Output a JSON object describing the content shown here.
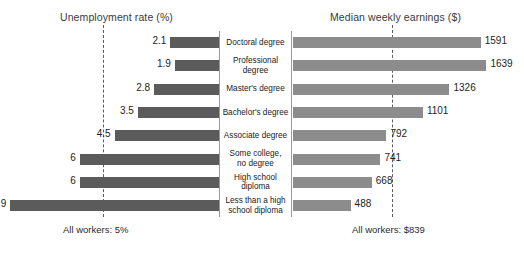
{
  "header": {
    "left_title": "Unemployment rate (%)",
    "right_title": "Median weekly earnings ($)"
  },
  "footer": {
    "left_note": "All workers: 5%",
    "right_note": "All workers: $839"
  },
  "rows": [
    {
      "category": "Doctoral degree",
      "rate": "2.1",
      "earnings": "1591"
    },
    {
      "category": "Professional\ndegree",
      "rate": "1.9",
      "earnings": "1639"
    },
    {
      "category": "Master's degree",
      "rate": "2.8",
      "earnings": "1326"
    },
    {
      "category": "Bachelor's degree",
      "rate": "3.5",
      "earnings": "1101"
    },
    {
      "category": "Associate degree",
      "rate": "4.5",
      "earnings": "792"
    },
    {
      "category": "Some college,\nno degree",
      "rate": "6",
      "earnings": "741"
    },
    {
      "category": "High school\ndiploma",
      "rate": "6",
      "earnings": "668"
    },
    {
      "category": "Less than a high\nschool diploma",
      "rate": "9",
      "earnings": "488"
    }
  ],
  "colors": {
    "unemployment_bar": "#5b5b5b",
    "earnings_bar": "#8c8c8c",
    "reference_line": "#5c5c5c",
    "panel_border": "#9a9a9a"
  },
  "chart_data": {
    "type": "bar",
    "orientation": "horizontal-tornado",
    "categories": [
      "Doctoral degree",
      "Professional degree",
      "Master's degree",
      "Bachelor's degree",
      "Associate degree",
      "Some college, no degree",
      "High school diploma",
      "Less than a high school diploma"
    ],
    "series": [
      {
        "name": "Unemployment rate (%)",
        "side": "left",
        "values": [
          2.1,
          1.9,
          2.8,
          3.5,
          4.5,
          6,
          6,
          9
        ],
        "color": "#5b5b5b",
        "axis_label": "Unemployment rate (%)",
        "xlim": [
          0,
          9.6
        ],
        "reference_line": {
          "value": 5,
          "label": "All workers: 5%"
        }
      },
      {
        "name": "Median weekly earnings ($)",
        "side": "right",
        "values": [
          1591,
          1639,
          1326,
          1101,
          792,
          741,
          668,
          488
        ],
        "color": "#8c8c8c",
        "axis_label": "Median weekly earnings ($)",
        "xlim": [
          0,
          1700
        ],
        "reference_line": {
          "value": 839,
          "label": "All workers: $839"
        }
      }
    ],
    "grid": false,
    "legend": "none",
    "xlabel": "",
    "ylabel": ""
  }
}
